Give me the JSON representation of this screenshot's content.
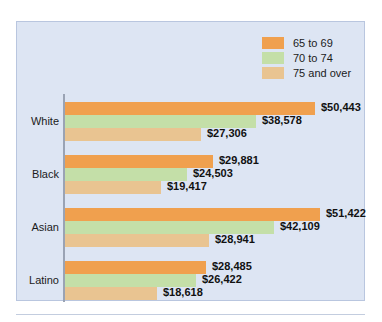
{
  "chart_data": {
    "type": "bar",
    "orientation": "horizontal",
    "title": "",
    "subtitle": "",
    "xlabel": "",
    "ylabel": "",
    "grid": false,
    "legend_position": "top-right",
    "axis_max": 55000,
    "categories": [
      "White",
      "Black",
      "Asian",
      "Latino"
    ],
    "series": [
      {
        "name": "65 to 69",
        "color": "#f0a04e",
        "values": [
          50443,
          29881,
          51422,
          28485
        ],
        "labels": [
          "$50,443",
          "$29,881",
          "$51,422",
          "$28,485"
        ]
      },
      {
        "name": "70 to 74",
        "color": "#c4dfa8",
        "values": [
          38578,
          24503,
          42109,
          26422
        ],
        "labels": [
          "$38,578",
          "$24,503",
          "$42,109",
          "$26,422"
        ]
      },
      {
        "name": "75 and over",
        "color": "#e9c491",
        "values": [
          27306,
          19417,
          28941,
          18618
        ],
        "labels": [
          "$27,306",
          "$19,417",
          "$28,941",
          "$18,618"
        ]
      }
    ]
  },
  "legend": {
    "items": [
      {
        "label": "65 to 69",
        "color": "#f0a04e"
      },
      {
        "label": "70 to 74",
        "color": "#c4dfa8"
      },
      {
        "label": "75 and over",
        "color": "#e9c491"
      }
    ]
  },
  "panel": {
    "background": "#dde5f3",
    "border": "#b9c6df",
    "axis_color": "#9aa3b4"
  }
}
